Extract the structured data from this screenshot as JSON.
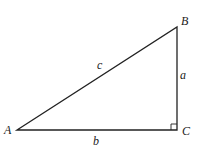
{
  "diagram": {
    "type": "right-triangle",
    "vertices": {
      "A": {
        "label": "A",
        "x": 17,
        "y": 130
      },
      "B": {
        "label": "B",
        "x": 177,
        "y": 27
      },
      "C": {
        "label": "C",
        "x": 177,
        "y": 130
      }
    },
    "sides": {
      "a": {
        "label": "a",
        "between": [
          "B",
          "C"
        ]
      },
      "b": {
        "label": "b",
        "between": [
          "A",
          "C"
        ]
      },
      "c": {
        "label": "c",
        "between": [
          "A",
          "B"
        ]
      }
    },
    "right_angle_at": "C",
    "stroke_color": "#222222"
  }
}
